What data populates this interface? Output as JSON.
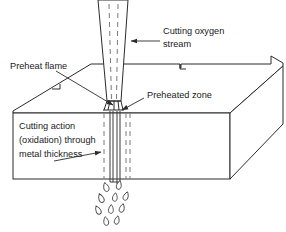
{
  "figure": {
    "background_color": "#ffffff",
    "line_color": "#2b2b2b",
    "dash_color": "#7a7a7a",
    "text_color": "#1a1a1a",
    "width": 286,
    "height": 232
  },
  "labels": {
    "cutting_oxygen_stream_line1": "Cutting oxygen",
    "cutting_oxygen_stream_line2": "stream",
    "preheat_flame": "Preheat flame",
    "preheated_zone": "Preheated zone",
    "cutting_action_line1": "Cutting action",
    "cutting_action_line2": "(oxidation) through",
    "cutting_action_line3": "metal thickness"
  },
  "parts": {
    "torch_nozzle": "torch-nozzle",
    "oxygen_stream_dashes": "oxygen-stream-dashes",
    "metal_plate": "metal-plate",
    "kerf": "kerf",
    "preheat_flame_cone": "preheat-flame-cone",
    "slag_droplets": "slag-droplets",
    "back_edge_notch": "back-edge-notch"
  },
  "droplets": [
    {
      "cx": 106,
      "cy": 187,
      "rx": 3.4,
      "ry": 4.6,
      "rot": -18
    },
    {
      "cx": 119,
      "cy": 185,
      "rx": 3.2,
      "ry": 4.4,
      "rot": 12
    },
    {
      "cx": 101,
      "cy": 198,
      "rx": 3.4,
      "ry": 4.6,
      "rot": -22
    },
    {
      "cx": 115,
      "cy": 197,
      "rx": 3.1,
      "ry": 4.3,
      "rot": 8
    },
    {
      "cx": 126,
      "cy": 196,
      "rx": 3.2,
      "ry": 4.4,
      "rot": 20
    },
    {
      "cx": 98,
      "cy": 210,
      "rx": 3.3,
      "ry": 4.5,
      "rot": -26
    },
    {
      "cx": 111,
      "cy": 209,
      "rx": 3.2,
      "ry": 4.4,
      "rot": 4
    },
    {
      "cx": 122,
      "cy": 208,
      "rx": 3.2,
      "ry": 4.4,
      "rot": 16
    },
    {
      "cx": 106,
      "cy": 221,
      "rx": 3.2,
      "ry": 4.4,
      "rot": -10
    },
    {
      "cx": 117,
      "cy": 220,
      "rx": 3.1,
      "ry": 4.3,
      "rot": 14
    }
  ]
}
